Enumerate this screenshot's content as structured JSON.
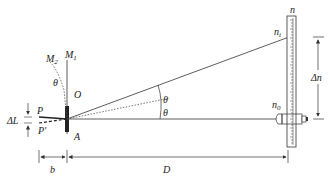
{
  "diagram": {
    "type": "optical-lever-schematic",
    "labels": {
      "mirror_m1": "M",
      "mirror_m1_sub": "1",
      "mirror_m2": "M",
      "mirror_m2_sub": "2",
      "theta_mirror": "θ",
      "point_o": "O",
      "point_a": "A",
      "point_p": "P",
      "point_p_prime": "P'",
      "delta_l": "ΔL",
      "theta_upper": "θ",
      "theta_lower": "θ",
      "n_top": "n",
      "n_i": "n",
      "n_i_sub": "i",
      "n_0": "n",
      "n_0_sub": "0",
      "delta_n": "Δn",
      "b": "b",
      "D": "D"
    },
    "colors": {
      "line": "#333333",
      "dotted": "#555555",
      "background": "#ffffff"
    }
  }
}
